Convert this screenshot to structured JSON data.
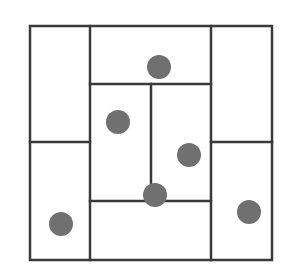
{
  "diagram": {
    "colors": {
      "background": "#ffffff",
      "line": "#3a3a3a",
      "dot": "#707070"
    },
    "line_width": 2.5,
    "outer_box": {
      "x": 30,
      "y": 26,
      "width": 242,
      "height": 234
    },
    "lines": [
      {
        "id": "v-left",
        "x1": 90,
        "y1": 26,
        "x2": 90,
        "y2": 260
      },
      {
        "id": "v-right",
        "x1": 211,
        "y1": 26,
        "x2": 211,
        "y2": 260
      },
      {
        "id": "h-top-center",
        "x1": 90,
        "y1": 84,
        "x2": 211,
        "y2": 84
      },
      {
        "id": "h-left-mid",
        "x1": 30,
        "y1": 142,
        "x2": 90,
        "y2": 142
      },
      {
        "id": "h-right-mid",
        "x1": 211,
        "y1": 142,
        "x2": 272,
        "y2": 142
      },
      {
        "id": "v-center",
        "x1": 151,
        "y1": 84,
        "x2": 151,
        "y2": 201
      },
      {
        "id": "h-bottom-center",
        "x1": 90,
        "y1": 201,
        "x2": 211,
        "y2": 201
      }
    ],
    "dots": [
      {
        "id": "dot-top-center",
        "cx": 159,
        "cy": 67,
        "r": 12
      },
      {
        "id": "dot-center-left",
        "cx": 118,
        "cy": 122,
        "r": 12
      },
      {
        "id": "dot-center-right",
        "cx": 189,
        "cy": 155,
        "r": 12
      },
      {
        "id": "dot-center-junction",
        "cx": 155,
        "cy": 195,
        "r": 12
      },
      {
        "id": "dot-bottom-left",
        "cx": 61,
        "cy": 224,
        "r": 12
      },
      {
        "id": "dot-bottom-right",
        "cx": 249,
        "cy": 212,
        "r": 12
      }
    ]
  }
}
